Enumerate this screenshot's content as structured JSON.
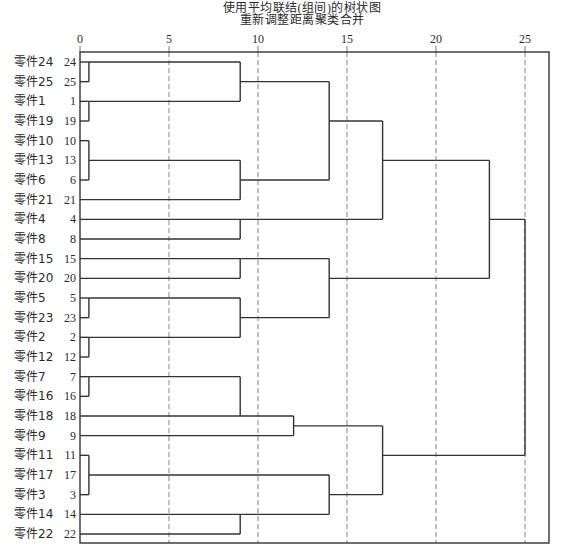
{
  "header": {
    "title_line1": "使用平均联结(组间)的树状图",
    "title_line2": "重新调整距离聚类合并"
  },
  "chart_data": {
    "type": "dendrogram",
    "title": "使用平均联结(组间)的树状图",
    "subtitle": "重新调整距离聚类合并",
    "xlabel": "",
    "ylabel": "",
    "xlim": [
      0,
      26.3
    ],
    "xticks": [
      0,
      5,
      10,
      15,
      20,
      25
    ],
    "grid": "vertical dashed at 5,10,15,20,25",
    "leaves": [
      {
        "name": "零件24",
        "id": "24"
      },
      {
        "name": "零件25",
        "id": "25"
      },
      {
        "name": "零件1",
        "id": "1"
      },
      {
        "name": "零件19",
        "id": "19"
      },
      {
        "name": "零件10",
        "id": "10"
      },
      {
        "name": "零件13",
        "id": "13"
      },
      {
        "name": "零件6",
        "id": "6"
      },
      {
        "name": "零件21",
        "id": "21"
      },
      {
        "name": "零件4",
        "id": "4"
      },
      {
        "name": "零件8",
        "id": "8"
      },
      {
        "name": "零件15",
        "id": "15"
      },
      {
        "name": "零件20",
        "id": "20"
      },
      {
        "name": "零件5",
        "id": "5"
      },
      {
        "name": "零件23",
        "id": "23"
      },
      {
        "name": "零件2",
        "id": "2"
      },
      {
        "name": "零件12",
        "id": "12"
      },
      {
        "name": "零件7",
        "id": "7"
      },
      {
        "name": "零件16",
        "id": "16"
      },
      {
        "name": "零件18",
        "id": "18"
      },
      {
        "name": "零件9",
        "id": "9"
      },
      {
        "name": "零件11",
        "id": "11"
      },
      {
        "name": "零件17",
        "id": "17"
      },
      {
        "name": "零件3",
        "id": "3"
      },
      {
        "name": "零件14",
        "id": "14"
      },
      {
        "name": "零件22",
        "id": "22"
      }
    ],
    "merges": [
      {
        "height": 0.5,
        "from_row": 0,
        "to_row": 1,
        "out_row": 0
      },
      {
        "height": 0.5,
        "from_row": 2,
        "to_row": 3,
        "out_row": 2
      },
      {
        "height": 0.5,
        "from_row": 4,
        "to_row": 6,
        "out_row": 5
      },
      {
        "height": 9,
        "from_row": 0,
        "to_row": 2,
        "out_row": 1
      },
      {
        "height": 9,
        "from_row": 5,
        "to_row": 7,
        "out_row": 6
      },
      {
        "height": 14,
        "from_row": 1,
        "to_row": 6,
        "out_row": 3
      },
      {
        "height": 9,
        "from_row": 8,
        "to_row": 9,
        "out_row": 8
      },
      {
        "height": 17,
        "from_row": 3,
        "to_row": 8,
        "out_row": 5
      },
      {
        "height": 9,
        "from_row": 10,
        "to_row": 11,
        "out_row": 10
      },
      {
        "height": 0.5,
        "from_row": 12,
        "to_row": 13,
        "out_row": 12
      },
      {
        "height": 0.5,
        "from_row": 14,
        "to_row": 15,
        "out_row": 14
      },
      {
        "height": 9,
        "from_row": 12,
        "to_row": 14,
        "out_row": 13
      },
      {
        "height": 14,
        "from_row": 10,
        "to_row": 13,
        "out_row": 11
      },
      {
        "height": 23,
        "from_row": 5,
        "to_row": 11,
        "out_row": 8
      },
      {
        "height": 0.5,
        "from_row": 16,
        "to_row": 17,
        "out_row": 16
      },
      {
        "height": 9,
        "from_row": 16,
        "to_row": 18,
        "out_row": 18
      },
      {
        "height": 12,
        "from_row": 18,
        "to_row": 19,
        "out_row": 18.5
      },
      {
        "height": 0.5,
        "from_row": 20,
        "to_row": 22,
        "out_row": 21
      },
      {
        "height": 9,
        "from_row": 23,
        "to_row": 24,
        "out_row": 23
      },
      {
        "height": 14,
        "from_row": 21,
        "to_row": 23,
        "out_row": 22
      },
      {
        "height": 17,
        "from_row": 18.5,
        "to_row": 22,
        "out_row": 20
      },
      {
        "height": 25,
        "from_row": 8,
        "to_row": 20,
        "out_row": 14
      }
    ],
    "clusters_at_height_25": 1
  },
  "footer": {
    "caption": ""
  }
}
